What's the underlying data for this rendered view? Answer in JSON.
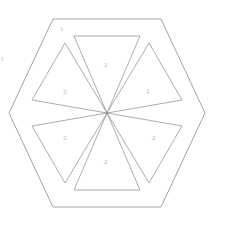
{
  "figure": {
    "kind": "hexagon-with-six-triangles",
    "stroke_color": "#8a8a8a",
    "label_color": "#b4b4b4",
    "background_color": "#ffffff",
    "center": {
      "x": 107,
      "y": 113
    },
    "outer_hexagon": {
      "name": "outer-hexagon",
      "circumradius": 98,
      "orientation": "flat-top",
      "vertices": [
        {
          "x": 53,
          "y": 19
        },
        {
          "x": 161,
          "y": 19
        },
        {
          "x": 205,
          "y": 113
        },
        {
          "x": 161,
          "y": 207
        },
        {
          "x": 53,
          "y": 207
        },
        {
          "x": 9,
          "y": 113
        }
      ]
    },
    "inner_triangles": [
      {
        "id": "triangle-top",
        "label": "2",
        "label_x": 104,
        "label_y": 62,
        "points": "74,36 140,36 107,113"
      },
      {
        "id": "triangle-upper-right",
        "label": "2",
        "label_x": 146,
        "label_y": 88,
        "points": "149,43 182,100 107,113"
      },
      {
        "id": "triangle-lower-right",
        "label": "2",
        "label_x": 152,
        "label_y": 135,
        "points": "182,126 149,183 107,113"
      },
      {
        "id": "triangle-bottom",
        "label": "2",
        "label_x": 104,
        "label_y": 159,
        "points": "140,190 74,190 107,113"
      },
      {
        "id": "triangle-lower-left",
        "label": "2",
        "label_x": 63,
        "label_y": 135,
        "points": "65,183 32,126 107,113"
      },
      {
        "id": "triangle-upper-left",
        "label": "2",
        "label_x": 63,
        "label_y": 89,
        "points": "32,100 65,43 107,113"
      }
    ],
    "annotations": [
      {
        "id": "label-corner-one",
        "name": "corner-label-1",
        "text": "1",
        "x": 60,
        "y": 26
      },
      {
        "id": "label-left-margin",
        "name": "left-margin-mark",
        "text": "r",
        "x": 1,
        "y": 55
      }
    ]
  }
}
